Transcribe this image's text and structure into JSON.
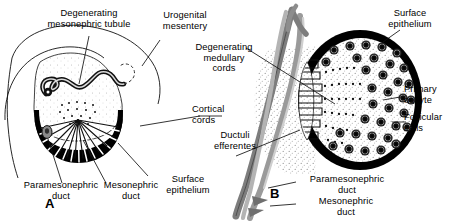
{
  "figure": {
    "background_color": "#ffffff",
    "ink_color": "#000000",
    "duct_gray": "#8f8f8f",
    "stipple_gray": "#bdbdbd"
  },
  "panels": [
    {
      "id": "A",
      "letter": "A",
      "caption": "Early indifferent/ovarian gonad in cross section with urogenital mesentery",
      "labels": [
        {
          "key": "degenerating_mesonephric_tubule",
          "text": "Degenerating\nmesonephric tubule"
        },
        {
          "key": "urogenital_mesentery",
          "text": "Urogenital\nmesentery"
        },
        {
          "key": "paramesonephric_duct",
          "text": "Paramesonephric\nduct"
        },
        {
          "key": "mesonephric_duct",
          "text": "Mesonephric\nduct"
        },
        {
          "key": "surface_epithelium",
          "text": "Surface\nepithelium"
        }
      ]
    },
    {
      "id": "B",
      "letter": "B",
      "caption": "Later ovary in cross section showing cortex filled with primary oocytes",
      "labels": [
        {
          "key": "degenerating_medullary_cords",
          "text": "Degenerating\nmedullary\ncords"
        },
        {
          "key": "cortical_cords",
          "text": "Cortical\ncords"
        },
        {
          "key": "ductuli_efferentes",
          "text": "Ductuli\nefferentes"
        },
        {
          "key": "surface_epithelium",
          "text": "Surface\nepithelium"
        },
        {
          "key": "primary_oocyte",
          "text": "Primary\noocyte"
        },
        {
          "key": "follicular_cells",
          "text": "Follicular\ncells"
        },
        {
          "key": "paramesonephric_duct",
          "text": "Paramesonephric\nduct"
        },
        {
          "key": "mesonephric_duct",
          "text": "Mesonephric\nduct"
        }
      ]
    }
  ],
  "structures": {
    "cortical_cord_count": 22,
    "medullary_cord_count": 6,
    "ductuli_efferentes_count": 9,
    "primary_oocyte_count": 34
  }
}
